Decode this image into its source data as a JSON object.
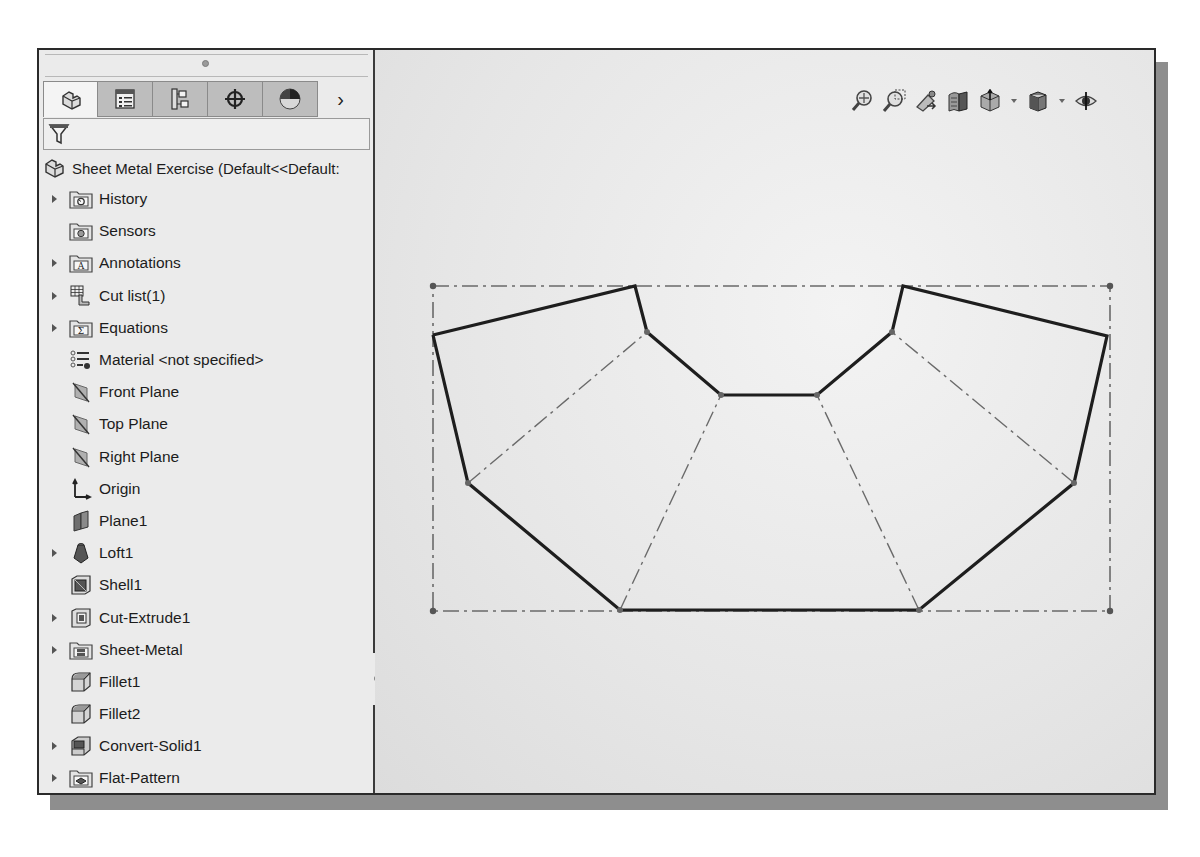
{
  "feature_manager": {
    "tabs": [
      {
        "name": "featuremanager-tab",
        "icon": "part-icon",
        "active": true
      },
      {
        "name": "propertymanager-tab",
        "icon": "property-list-icon",
        "active": false
      },
      {
        "name": "configurationmanager-tab",
        "icon": "configuration-icon",
        "active": false
      },
      {
        "name": "dimxpertmanager-tab",
        "icon": "crosshair-icon",
        "active": false
      },
      {
        "name": "displaymanager-tab",
        "icon": "appearance-sphere-icon",
        "active": false
      }
    ],
    "more_tabs_label": "›",
    "filter": {
      "icon": "filter-icon",
      "value": ""
    },
    "root": {
      "label": "Sheet Metal Exercise  (Default<<Default:",
      "icon": "part-icon"
    },
    "items": [
      {
        "label": "History",
        "icon": "history-folder-icon",
        "expandable": true
      },
      {
        "label": "Sensors",
        "icon": "sensors-folder-icon",
        "expandable": false
      },
      {
        "label": "Annotations",
        "icon": "annotations-folder-icon",
        "expandable": true
      },
      {
        "label": "Cut list(1)",
        "icon": "cut-list-icon",
        "expandable": true
      },
      {
        "label": "Equations",
        "icon": "equations-folder-icon",
        "expandable": true
      },
      {
        "label": "Material <not specified>",
        "icon": "material-icon",
        "expandable": false
      },
      {
        "label": "Front Plane",
        "icon": "plane-icon",
        "expandable": false
      },
      {
        "label": "Top Plane",
        "icon": "plane-icon",
        "expandable": false
      },
      {
        "label": "Right Plane",
        "icon": "plane-icon",
        "expandable": false
      },
      {
        "label": "Origin",
        "icon": "origin-icon",
        "expandable": false
      },
      {
        "label": "Plane1",
        "icon": "ref-plane-icon",
        "expandable": false
      },
      {
        "label": "Loft1",
        "icon": "loft-icon",
        "expandable": true
      },
      {
        "label": "Shell1",
        "icon": "shell-icon",
        "expandable": false
      },
      {
        "label": "Cut-Extrude1",
        "icon": "cut-extrude-icon",
        "expandable": true
      },
      {
        "label": "Sheet-Metal",
        "icon": "sheet-metal-folder-icon",
        "expandable": true
      },
      {
        "label": "Fillet1",
        "icon": "fillet-icon",
        "expandable": false
      },
      {
        "label": "Fillet2",
        "icon": "fillet-icon",
        "expandable": false
      },
      {
        "label": "Convert-Solid1",
        "icon": "convert-solid-icon",
        "expandable": true
      },
      {
        "label": "Flat-Pattern",
        "icon": "flat-pattern-folder-icon",
        "expandable": true
      }
    ]
  },
  "heads_up_toolbar": [
    {
      "name": "zoom-to-fit",
      "icon": "zoom-to-fit-icon",
      "dropdown": false
    },
    {
      "name": "zoom-to-area",
      "icon": "zoom-to-area-icon",
      "dropdown": false
    },
    {
      "name": "previous-view",
      "icon": "previous-view-icon",
      "dropdown": false
    },
    {
      "name": "section-view",
      "icon": "section-view-icon",
      "dropdown": false
    },
    {
      "name": "view-orientation",
      "icon": "view-orientation-icon",
      "dropdown": true
    },
    {
      "name": "display-style",
      "icon": "display-style-icon",
      "dropdown": true
    },
    {
      "name": "hide-show-items",
      "icon": "hide-show-eye-icon",
      "dropdown": false
    }
  ],
  "sketch": {
    "outline_color": "#1e1e1e",
    "bendline_color": "#6a6a6a",
    "bbox_color": "#6a6a6a",
    "outline_points": [
      [
        433,
        335
      ],
      [
        635,
        286
      ],
      [
        647,
        332
      ],
      [
        721,
        395
      ],
      [
        817,
        395
      ],
      [
        892,
        332
      ],
      [
        903,
        286
      ],
      [
        1107,
        336
      ],
      [
        1074,
        483
      ],
      [
        919,
        610
      ],
      [
        620,
        610
      ],
      [
        468,
        483
      ],
      [
        433,
        335
      ]
    ],
    "bend_lines": [
      [
        [
          468,
          483
        ],
        [
          647,
          332
        ]
      ],
      [
        [
          620,
          610
        ],
        [
          721,
          395
        ]
      ],
      [
        [
          919,
          610
        ],
        [
          817,
          395
        ]
      ],
      [
        [
          1074,
          483
        ],
        [
          892,
          332
        ]
      ]
    ],
    "vertex_dots": [
      [
        647,
        332
      ],
      [
        721,
        395
      ],
      [
        817,
        395
      ],
      [
        892,
        332
      ],
      [
        468,
        483
      ],
      [
        1074,
        483
      ],
      [
        620,
        610
      ],
      [
        919,
        610
      ]
    ],
    "bounding_box": {
      "x1": 433,
      "y1": 286,
      "x2": 1110,
      "y2": 611
    }
  }
}
